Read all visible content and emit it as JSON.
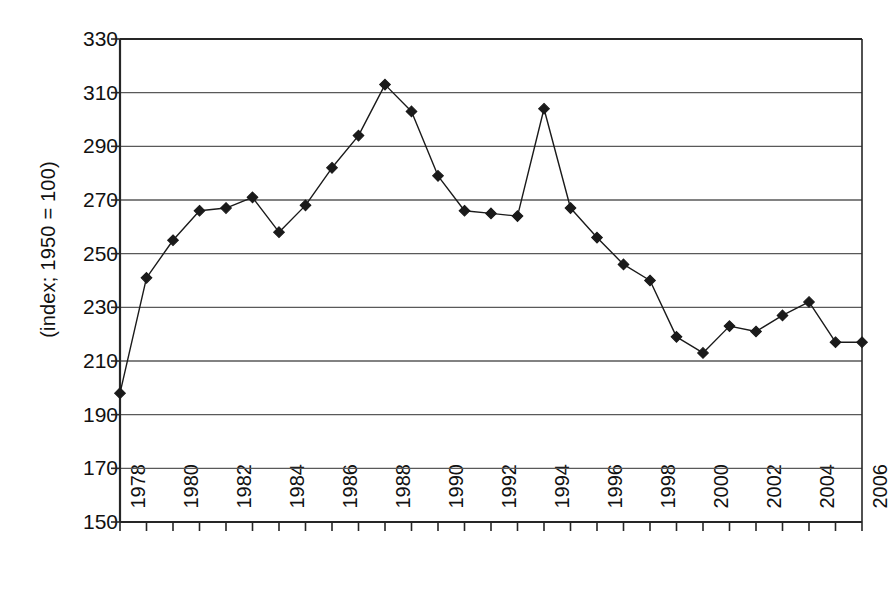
{
  "chart_data": {
    "type": "line",
    "title": "",
    "subtitle": "",
    "xlabel": "",
    "ylabel": "(index; 1950 = 100)",
    "ylim": [
      150,
      330
    ],
    "ytick_step": 20,
    "yticks": [
      330,
      310,
      290,
      270,
      250,
      230,
      210,
      190,
      170,
      150
    ],
    "xlim": [
      1978,
      2006
    ],
    "xticks": [
      1978,
      1979,
      1980,
      1981,
      1982,
      1983,
      1984,
      1985,
      1986,
      1987,
      1988,
      1989,
      1990,
      1991,
      1992,
      1993,
      1994,
      1995,
      1996,
      1997,
      1998,
      1999,
      2000,
      2001,
      2002,
      2003,
      2004,
      2005,
      2006
    ],
    "xtick_labels": [
      "1978",
      "",
      "1980",
      "",
      "1982",
      "",
      "1984",
      "",
      "1986",
      "",
      "1988",
      "",
      "1990",
      "",
      "1992",
      "",
      "1994",
      "",
      "1996",
      "",
      "1998",
      "",
      "2000",
      "",
      "2002",
      "",
      "2004",
      "",
      "2006"
    ],
    "x": [
      1978,
      1979,
      1980,
      1981,
      1982,
      1983,
      1984,
      1985,
      1986,
      1987,
      1988,
      1989,
      1990,
      1991,
      1992,
      1993,
      1994,
      1995,
      1996,
      1997,
      1998,
      1999,
      2000,
      2001,
      2002,
      2003,
      2004,
      2005,
      2006
    ],
    "values": [
      198,
      241,
      255,
      266,
      267,
      271,
      258,
      268,
      282,
      294,
      313,
      303,
      279,
      266,
      265,
      264,
      304,
      267,
      256,
      246,
      240,
      219,
      213,
      223,
      221,
      227,
      232,
      217,
      217
    ],
    "grid": {
      "horizontal": true,
      "vertical": false,
      "color": "#595959"
    },
    "legend": {
      "visible": false,
      "position": "none",
      "entries": []
    },
    "series_style": {
      "line_color": "#1a1a1a",
      "line_width": 1.4,
      "marker": "diamond",
      "marker_color": "#1a1a1a",
      "marker_size": 9
    },
    "axis_color": "#262626",
    "background": "#ffffff"
  }
}
